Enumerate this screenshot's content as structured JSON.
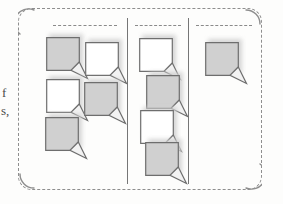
{
  "figure": {
    "kind": "sticky-note-board-illustration",
    "background_color": "#fdfdfc",
    "boundary": {
      "name": "board-boundary",
      "style": "dashed",
      "corner_style": "rounded-solid",
      "color": "#8e8e8e",
      "corner_radius": 14
    },
    "divider_color": "#767676",
    "header_rule_color": "#8a8a8a"
  },
  "margin_text": {
    "fragment_1": "f",
    "fragment_2": "s,"
  },
  "note_style": {
    "gray_fill": "#d0d0d0",
    "white_fill": "#ffffff",
    "border_color": "#6e6e6e",
    "fold_fill": "#f2f2f2",
    "shadow_color": "#cfcfcf",
    "size": 34,
    "fold_size": 9
  },
  "columns": [
    {
      "id": "column-1",
      "label": "Column 1",
      "header_rule": {
        "left": 53,
        "width": 64
      },
      "note_count": 5,
      "notes": [
        {
          "id": "note-1-1",
          "fill": "gray",
          "x": 46,
          "y": 37
        },
        {
          "id": "note-1-2",
          "fill": "white",
          "x": 85,
          "y": 42
        },
        {
          "id": "note-1-3",
          "fill": "white",
          "x": 46,
          "y": 79
        },
        {
          "id": "note-1-4",
          "fill": "gray",
          "x": 84,
          "y": 82
        },
        {
          "id": "note-1-5",
          "fill": "gray",
          "x": 45,
          "y": 117
        }
      ]
    },
    {
      "id": "column-2",
      "label": "Column 2",
      "header_rule": {
        "left": 135,
        "width": 46
      },
      "note_count": 4,
      "notes": [
        {
          "id": "note-2-1",
          "fill": "white",
          "x": 139,
          "y": 38
        },
        {
          "id": "note-2-2",
          "fill": "gray",
          "x": 146,
          "y": 75
        },
        {
          "id": "note-2-3",
          "fill": "white",
          "x": 140,
          "y": 110
        },
        {
          "id": "note-2-4",
          "fill": "gray",
          "x": 145,
          "y": 142
        }
      ]
    },
    {
      "id": "column-3",
      "label": "Column 3",
      "header_rule": {
        "left": 196,
        "width": 56
      },
      "note_count": 1,
      "notes": [
        {
          "id": "note-3-1",
          "fill": "gray",
          "x": 205,
          "y": 42
        }
      ]
    }
  ]
}
